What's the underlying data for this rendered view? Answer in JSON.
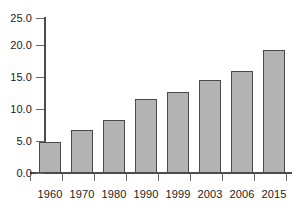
{
  "chart_data": {
    "type": "bar",
    "title": "",
    "subtitle": "",
    "xlabel": "",
    "ylabel": "",
    "categories": [
      "1960",
      "1970",
      "1980",
      "1990",
      "1999",
      "2003",
      "2006",
      "2015"
    ],
    "values": [
      5.0,
      6.9,
      8.6,
      12.0,
      13.1,
      15.0,
      16.5,
      19.8
    ],
    "series": [
      {
        "name": "",
        "values": [
          5.0,
          6.9,
          8.6,
          12.0,
          13.1,
          15.0,
          16.5,
          19.8
        ]
      }
    ],
    "ylim": [
      0.0,
      25.0
    ],
    "ytick_labels": [
      "0.0",
      "5.0",
      "10.0",
      "15.0",
      "20.0",
      "25.0"
    ],
    "ytick_values": [
      0.0,
      5.0,
      10.0,
      15.0,
      20.0,
      25.0
    ],
    "xtick_labels": [
      "1960",
      "1970",
      "1980",
      "1990",
      "1999",
      "2003",
      "2006",
      "2015"
    ],
    "grid": false,
    "legend": false,
    "legend_position": "none",
    "annotations": [],
    "colors": {
      "bar_fill": "#b3b3b3",
      "bar_border": "#4a4a4a",
      "axis": "#4d4d4d",
      "text": "#1a1a1a",
      "background": "#ffffff"
    }
  }
}
